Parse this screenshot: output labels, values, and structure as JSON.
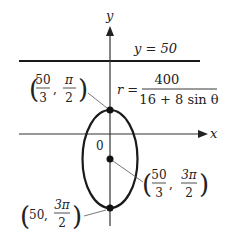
{
  "diagram": {
    "axes": {
      "x_label": "x",
      "y_label": "y",
      "origin_label": "0"
    },
    "directrix": {
      "label": "y = 50"
    },
    "equation": {
      "lhs": "r =",
      "numerator": "400",
      "denominator": "16 + 8 sin θ"
    },
    "points": [
      {
        "name": "top-vertex",
        "r_num": "50",
        "r_den": "3",
        "theta_num": "π",
        "theta_den": "2"
      },
      {
        "name": "focus-center",
        "r_num": "50",
        "r_den": "3",
        "theta_num": "3π",
        "theta_den": "2"
      },
      {
        "name": "bottom-vertex",
        "r": "50",
        "theta_num": "3π",
        "theta_den": "2"
      }
    ],
    "colors": {
      "stroke": "#1a1a1a",
      "leader": "#555555"
    }
  }
}
